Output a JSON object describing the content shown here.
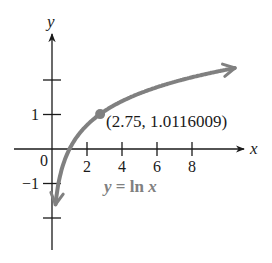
{
  "chart_data": {
    "type": "line",
    "title": "",
    "xlabel": "x",
    "ylabel": "y",
    "function_label": "y = ln x",
    "series": [
      {
        "name": "y = ln x",
        "color": "#808080",
        "x": [
          0.15,
          0.25,
          0.5,
          0.75,
          1,
          1.5,
          2,
          2.75,
          3,
          4,
          5,
          6,
          7,
          8,
          9,
          10.5
        ],
        "values": [
          -1.897,
          -1.386,
          -0.693,
          -0.288,
          0,
          0.405,
          0.693,
          1.0116,
          1.099,
          1.386,
          1.609,
          1.792,
          1.946,
          2.079,
          2.197,
          2.351
        ]
      }
    ],
    "highlight_point": {
      "x": 2.75,
      "y": 1.0116009,
      "label": "(2.75, 1.0116009)"
    },
    "x_ticks": [
      2,
      4,
      6,
      8
    ],
    "x_tick_labels": [
      "2",
      "4",
      "6",
      "8"
    ],
    "y_ticks": [
      -2,
      -1,
      1,
      2
    ],
    "y_tick_labels": [
      "",
      "−1",
      "1",
      ""
    ],
    "origin_label": "0",
    "xlim": [
      -0.5,
      11
    ],
    "ylim": [
      -2.9,
      3.3
    ],
    "grid": false,
    "legend": "none"
  },
  "colors": {
    "axis": "#1a1a1a",
    "curve": "#808080",
    "label": "#808080"
  }
}
